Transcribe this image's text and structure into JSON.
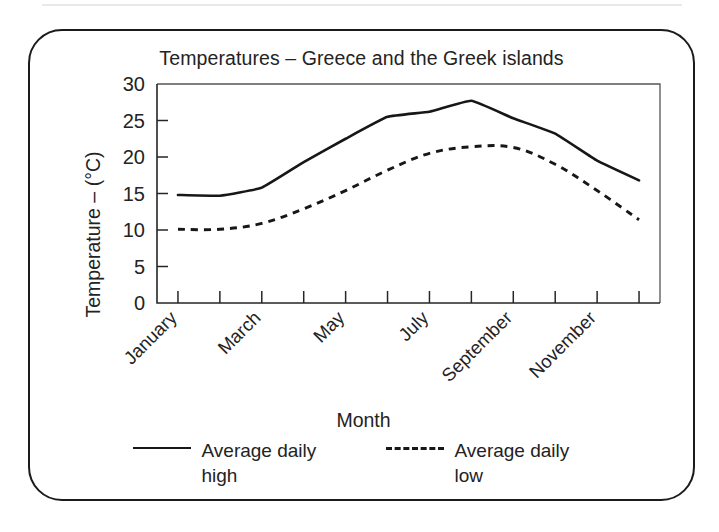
{
  "figure": {
    "title": "Temperatures – Greece and the Greek islands",
    "x_axis_title": "Month",
    "y_axis_title": "Temperature – (°C)"
  },
  "legend": {
    "items": [
      {
        "label": "Average daily high",
        "style": "solid"
      },
      {
        "label": "Average daily low",
        "style": "dashed"
      }
    ]
  },
  "chart_data": {
    "type": "line",
    "title": "Temperatures – Greece and the Greek islands",
    "xlabel": "Month",
    "ylabel": "Temperature – (°C)",
    "ylim": [
      0,
      30
    ],
    "yticks": [
      0,
      5,
      10,
      15,
      20,
      25,
      30
    ],
    "ytick_labels": [
      "0",
      "5",
      "10",
      "15",
      "20",
      "25",
      "30"
    ],
    "grid": false,
    "legend_position": "bottom",
    "categories": [
      "January",
      "February",
      "March",
      "April",
      "May",
      "June",
      "July",
      "August",
      "September",
      "October",
      "November",
      "December"
    ],
    "xtick_labels_shown": [
      "January",
      "March",
      "May",
      "July",
      "September",
      "November"
    ],
    "xtick_label_rotation_deg": 45,
    "series": [
      {
        "name": "Average daily high",
        "style": "solid",
        "values": [
          14.8,
          14.7,
          15.8,
          19.3,
          22.5,
          25.5,
          26.2,
          27.7,
          25.3,
          23.2,
          19.5,
          16.8
        ]
      },
      {
        "name": "Average daily low",
        "style": "dashed",
        "values": [
          10.1,
          10.1,
          10.9,
          12.9,
          15.4,
          18.2,
          20.5,
          21.4,
          21.3,
          19.0,
          15.4,
          11.4
        ]
      }
    ]
  },
  "colors": {
    "line": "#171717",
    "text": "#232323",
    "border": "#1b1b1b"
  }
}
